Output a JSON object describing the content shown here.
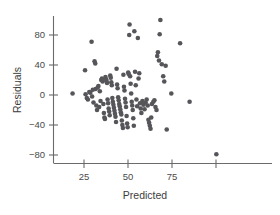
{
  "chart_data": {
    "type": "scatter",
    "title": "",
    "xlabel": "Predicted",
    "ylabel": "Residuals",
    "xlim": [
      14,
      104
    ],
    "ylim": [
      -99,
      104
    ],
    "grid": false,
    "legend": null,
    "xticks": [
      25,
      50,
      75,
      100
    ],
    "xtick_labels": [
      "25",
      "50",
      "75",
      ""
    ],
    "yticks": [
      80,
      40,
      0,
      -40,
      -80
    ],
    "ytick_labels": [
      "80",
      "40",
      "0",
      "−40",
      "−80"
    ],
    "marker": {
      "shape": "circle",
      "color": "#56565a",
      "size_px": 4.6
    },
    "series": [
      {
        "name": "residuals",
        "points": [
          [
            18.5,
            2
          ],
          [
            25.6,
            33
          ],
          [
            25.9,
            1
          ],
          [
            26.6,
            -4
          ],
          [
            27.2,
            -6
          ],
          [
            28.0,
            4
          ],
          [
            28.6,
            3
          ],
          [
            29.3,
            71
          ],
          [
            29.6,
            -2
          ],
          [
            30.0,
            7
          ],
          [
            30.4,
            -10
          ],
          [
            31.0,
            45
          ],
          [
            31.4,
            42
          ],
          [
            31.6,
            8
          ],
          [
            32.0,
            -14
          ],
          [
            32.4,
            -20
          ],
          [
            32.8,
            10
          ],
          [
            33.2,
            12
          ],
          [
            33.6,
            -16
          ],
          [
            34.0,
            5
          ],
          [
            34.4,
            -8
          ],
          [
            34.8,
            20
          ],
          [
            35.2,
            22
          ],
          [
            35.6,
            18
          ],
          [
            36.0,
            -12
          ],
          [
            36.3,
            -24
          ],
          [
            36.6,
            -30
          ],
          [
            36.9,
            -32
          ],
          [
            37.2,
            24
          ],
          [
            37.5,
            21
          ],
          [
            37.8,
            19
          ],
          [
            38.1,
            16
          ],
          [
            38.4,
            -6
          ],
          [
            38.7,
            -11
          ],
          [
            39.0,
            -18
          ],
          [
            39.3,
            -22
          ],
          [
            39.6,
            -27
          ],
          [
            39.9,
            26
          ],
          [
            40.2,
            23
          ],
          [
            40.5,
            17
          ],
          [
            40.8,
            13
          ],
          [
            41.1,
            -4
          ],
          [
            41.4,
            -9
          ],
          [
            41.7,
            -13
          ],
          [
            42.0,
            -17
          ],
          [
            42.3,
            -21
          ],
          [
            42.6,
            -25
          ],
          [
            42.9,
            -29
          ],
          [
            43.2,
            -36
          ],
          [
            43.5,
            35
          ],
          [
            43.8,
            14
          ],
          [
            44.1,
            9
          ],
          [
            44.4,
            -3
          ],
          [
            44.7,
            -7
          ],
          [
            45.0,
            -12
          ],
          [
            45.3,
            -15
          ],
          [
            45.6,
            -19
          ],
          [
            45.9,
            -23
          ],
          [
            46.2,
            -26
          ],
          [
            46.5,
            -34
          ],
          [
            46.8,
            -40
          ],
          [
            47.1,
            -44
          ],
          [
            47.4,
            27
          ],
          [
            47.7,
            11
          ],
          [
            48.0,
            6
          ],
          [
            48.3,
            -5
          ],
          [
            48.6,
            -10
          ],
          [
            48.9,
            -16
          ],
          [
            49.2,
            -28
          ],
          [
            49.5,
            -38
          ],
          [
            49.8,
            -43
          ],
          [
            50.1,
            30
          ],
          [
            50.4,
            28
          ],
          [
            50.7,
            80
          ],
          [
            50.9,
            94
          ],
          [
            51.2,
            25
          ],
          [
            51.5,
            15
          ],
          [
            51.8,
            2
          ],
          [
            52.1,
            -9
          ],
          [
            52.4,
            -14
          ],
          [
            52.7,
            -20
          ],
          [
            53.0,
            -31
          ],
          [
            53.3,
            -41
          ],
          [
            53.6,
            85
          ],
          [
            54.0,
            31
          ],
          [
            54.4,
            13
          ],
          [
            54.8,
            -6
          ],
          [
            55.2,
            -15
          ],
          [
            55.6,
            76
          ],
          [
            56.0,
            22
          ],
          [
            56.4,
            29
          ],
          [
            56.8,
            -11
          ],
          [
            57.2,
            -18
          ],
          [
            57.6,
            -24
          ],
          [
            58.2,
            -8
          ],
          [
            58.8,
            -13
          ],
          [
            59.4,
            -19
          ],
          [
            60.0,
            -10
          ],
          [
            60.6,
            -6
          ],
          [
            61.2,
            -14
          ],
          [
            61.6,
            -33
          ],
          [
            62.0,
            -37
          ],
          [
            62.4,
            -41
          ],
          [
            62.8,
            -45
          ],
          [
            63.2,
            -30
          ],
          [
            63.6,
            -12
          ],
          [
            64.4,
            -9
          ],
          [
            65.0,
            -7
          ],
          [
            65.6,
            -16
          ],
          [
            66.2,
            -20
          ],
          [
            66.6,
            52
          ],
          [
            67.0,
            57
          ],
          [
            67.6,
            46
          ],
          [
            68.0,
            81
          ],
          [
            68.4,
            100
          ],
          [
            69.2,
            41
          ],
          [
            70.0,
            25
          ],
          [
            70.6,
            18
          ],
          [
            71.4,
            39
          ],
          [
            72.0,
            -46
          ],
          [
            74.6,
            2
          ],
          [
            79.6,
            69
          ],
          [
            85.0,
            -9
          ],
          [
            100.2,
            -79
          ]
        ]
      }
    ]
  },
  "axes": {
    "y_axis_title": "Residuals",
    "x_axis_title": "Predicted"
  }
}
